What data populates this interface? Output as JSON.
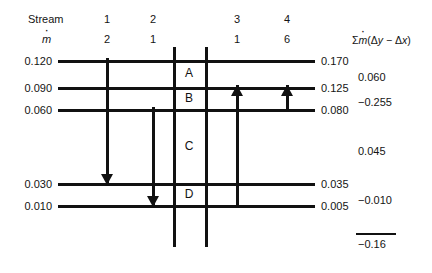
{
  "header": {
    "stream_label": "Stream",
    "massflow_label": "ṁ",
    "sum_header": "Σṁ(Δy − Δx)"
  },
  "streams": [
    {
      "id": "1",
      "number": "1",
      "mdot": "2",
      "x": 107,
      "direction": "down",
      "from_level": "0.120",
      "to_level": "0.030"
    },
    {
      "id": "2",
      "number": "2",
      "mdot": "1",
      "x": 153,
      "direction": "down",
      "from_level": "0.060",
      "to_level": "0.010"
    },
    {
      "id": "3",
      "number": "3",
      "mdot": "1",
      "x": 237,
      "direction": "up",
      "from_level": "0.010",
      "to_level": "0.090"
    },
    {
      "id": "4",
      "number": "4",
      "mdot": "6",
      "x": 287,
      "direction": "up",
      "from_level": "0.060",
      "to_level": "0.090"
    }
  ],
  "levels": [
    {
      "left_value": "0.120",
      "right_value": "0.170",
      "y": 60
    },
    {
      "left_value": "0.090",
      "right_value": "0.125",
      "y": 87
    },
    {
      "left_value": "0.060",
      "right_value": "0.080",
      "y": 109
    },
    {
      "left_value": "0.030",
      "right_value": "0.035",
      "y": 183
    },
    {
      "left_value": "0.010",
      "right_value": "0.005",
      "y": 205
    }
  ],
  "stages": [
    {
      "letter": "A",
      "y": 73
    },
    {
      "letter": "B",
      "y": 98
    },
    {
      "letter": "C",
      "y": 146
    },
    {
      "letter": "D",
      "y": 194
    }
  ],
  "sums": [
    {
      "value": "0.060",
      "y": 71
    },
    {
      "value": "−0.255",
      "y": 96
    },
    {
      "value": "0.045",
      "y": 145
    },
    {
      "value": "−0.010",
      "y": 194
    }
  ],
  "total": {
    "value": "−0.16"
  },
  "chart_data": {
    "type": "diagram",
    "stream_numbers": [
      "1",
      "2",
      "3",
      "4"
    ],
    "stream_mass_flows": [
      2,
      1,
      1,
      6
    ],
    "stream_directions": [
      "down",
      "down",
      "up",
      "up"
    ],
    "left_axis_values": [
      0.12,
      0.09,
      0.06,
      0.03,
      0.01
    ],
    "right_axis_values": [
      0.17,
      0.125,
      0.08,
      0.035,
      0.005
    ],
    "stage_labels": [
      "A",
      "B",
      "C",
      "D"
    ],
    "stage_sums": [
      0.06,
      -0.255,
      0.045,
      -0.01
    ],
    "total_sum": -0.16,
    "sum_column_header": "Σṁ(Δy − Δx)"
  }
}
